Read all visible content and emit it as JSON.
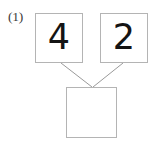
{
  "figure": {
    "kind": "number-bond-diagram",
    "item_label": "(1)",
    "background_color": "#ffffff",
    "box_border_color": "#b4b4b4",
    "connector_color": "#9a9a9a",
    "digit_color": "#141414"
  },
  "boxes": {
    "part_a": {
      "name": "top-left-addend",
      "value": "4",
      "filled": true
    },
    "part_b": {
      "name": "top-right-addend",
      "value": "2",
      "filled": true
    },
    "total": {
      "name": "bottom-total",
      "value": "",
      "filled": false
    }
  },
  "connectors": [
    {
      "name": "left-connector",
      "from_x": 61,
      "from_y": 63,
      "to_x": 92,
      "to_y": 87
    },
    {
      "name": "right-connector",
      "from_x": 123,
      "from_y": 63,
      "to_x": 93,
      "to_y": 87
    }
  ]
}
